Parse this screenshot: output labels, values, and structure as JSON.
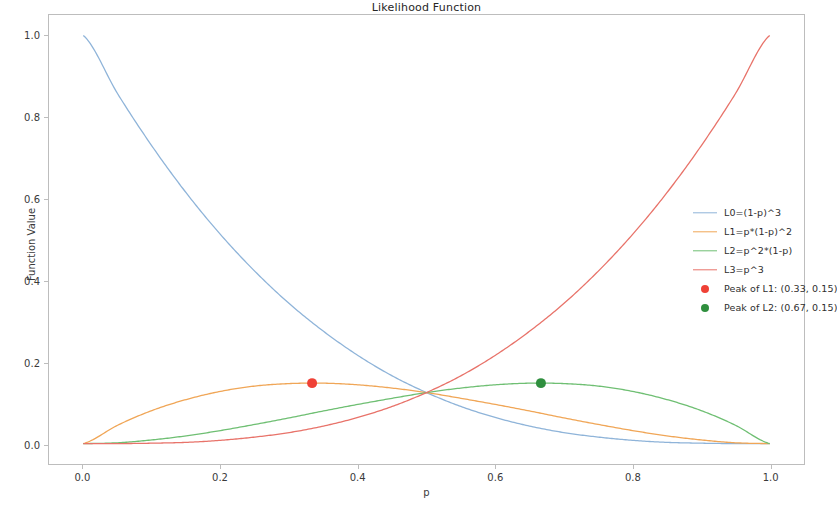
{
  "chart_data": {
    "type": "line",
    "title": "Likelihood Function",
    "xlabel": "p",
    "ylabel": "Function Value",
    "xlim": [
      -0.05,
      1.05
    ],
    "ylim": [
      -0.05,
      1.05
    ],
    "xticks": [
      "0.0",
      "0.2",
      "0.4",
      "0.6",
      "0.8",
      "1.0"
    ],
    "xtick_values": [
      0.0,
      0.2,
      0.4,
      0.6,
      0.8,
      1.0
    ],
    "yticks": [
      "0.0",
      "0.2",
      "0.4",
      "0.6",
      "0.8",
      "1.0"
    ],
    "ytick_values": [
      0.0,
      0.2,
      0.4,
      0.6,
      0.8,
      1.0
    ],
    "grid": false,
    "legend_position": "center right",
    "series": [
      {
        "name": "L0=(1-p)^3",
        "color": "#8fb4d9",
        "kind": "line",
        "x": [
          0.0,
          0.05,
          0.1,
          0.15,
          0.2,
          0.25,
          0.3,
          0.35,
          0.4,
          0.45,
          0.5,
          0.55,
          0.6,
          0.65,
          0.7,
          0.75,
          0.8,
          0.85,
          0.9,
          0.95,
          1.0
        ],
        "values": [
          1.0,
          0.857,
          0.729,
          0.614,
          0.512,
          0.422,
          0.343,
          0.275,
          0.216,
          0.166,
          0.125,
          0.091,
          0.064,
          0.043,
          0.027,
          0.016,
          0.008,
          0.003,
          0.001,
          0.0,
          0.0
        ]
      },
      {
        "name": "L1=p*(1-p)^2",
        "color": "#f0a657",
        "kind": "line",
        "x": [
          0.0,
          0.05,
          0.1,
          0.15,
          0.2,
          0.25,
          0.3,
          0.35,
          0.4,
          0.45,
          0.5,
          0.55,
          0.6,
          0.65,
          0.7,
          0.75,
          0.8,
          0.85,
          0.9,
          0.95,
          1.0
        ],
        "values": [
          0.0,
          0.045,
          0.081,
          0.108,
          0.128,
          0.141,
          0.147,
          0.148,
          0.144,
          0.136,
          0.125,
          0.111,
          0.096,
          0.08,
          0.063,
          0.047,
          0.032,
          0.019,
          0.009,
          0.002,
          0.0
        ]
      },
      {
        "name": "L2=p^2*(1-p)",
        "color": "#6fbf73",
        "kind": "line",
        "x": [
          0.0,
          0.05,
          0.1,
          0.15,
          0.2,
          0.25,
          0.3,
          0.35,
          0.4,
          0.45,
          0.5,
          0.55,
          0.6,
          0.65,
          0.7,
          0.75,
          0.8,
          0.85,
          0.9,
          0.95,
          1.0
        ],
        "values": [
          0.0,
          0.002,
          0.009,
          0.019,
          0.032,
          0.047,
          0.063,
          0.08,
          0.096,
          0.111,
          0.125,
          0.136,
          0.144,
          0.148,
          0.147,
          0.141,
          0.128,
          0.108,
          0.081,
          0.045,
          0.0
        ]
      },
      {
        "name": "L3=p^3",
        "color": "#e8736a",
        "kind": "line",
        "x": [
          0.0,
          0.05,
          0.1,
          0.15,
          0.2,
          0.25,
          0.3,
          0.35,
          0.4,
          0.45,
          0.5,
          0.55,
          0.6,
          0.65,
          0.7,
          0.75,
          0.8,
          0.85,
          0.9,
          0.95,
          1.0
        ],
        "values": [
          0.0,
          0.0,
          0.001,
          0.003,
          0.008,
          0.016,
          0.027,
          0.043,
          0.064,
          0.091,
          0.125,
          0.166,
          0.216,
          0.275,
          0.343,
          0.422,
          0.512,
          0.614,
          0.729,
          0.857,
          1.0
        ]
      },
      {
        "name": "Peak of L1: (0.33, 0.15)",
        "color": "#ef4136",
        "kind": "marker",
        "x": [
          0.3333
        ],
        "values": [
          0.1481
        ]
      },
      {
        "name": "Peak of L2: (0.67, 0.15)",
        "color": "#2f8f3e",
        "kind": "marker",
        "x": [
          0.6667
        ],
        "values": [
          0.1481
        ]
      }
    ]
  },
  "legend": {
    "entries": [
      {
        "label": "L0=(1-p)^3",
        "color": "#8fb4d9",
        "kind": "line"
      },
      {
        "label": "L1=p*(1-p)^2",
        "color": "#f0a657",
        "kind": "line"
      },
      {
        "label": "L2=p^2*(1-p)",
        "color": "#6fbf73",
        "kind": "line"
      },
      {
        "label": "L3=p^3",
        "color": "#e8736a",
        "kind": "line"
      },
      {
        "label": "Peak of L1: (0.33, 0.15)",
        "color": "#ef4136",
        "kind": "marker"
      },
      {
        "label": "Peak of L2: (0.67, 0.15)",
        "color": "#2f8f3e",
        "kind": "marker"
      }
    ]
  }
}
